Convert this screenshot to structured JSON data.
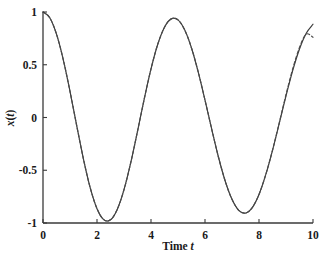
{
  "chart_data": {
    "type": "line",
    "title": "",
    "subtitle": "",
    "xlabel": "Time t",
    "xlabel_plain": "Time",
    "xlabel_italic": "t",
    "ylabel": "x(t)",
    "ylabel_italic_parts": [
      "x",
      "t"
    ],
    "xlim": [
      0,
      10
    ],
    "ylim": [
      -1,
      1
    ],
    "xticks": [
      0,
      2,
      4,
      6,
      8,
      10
    ],
    "xtick_labels": [
      "0",
      "2",
      "4",
      "6",
      "8",
      "10"
    ],
    "yticks": [
      -1,
      -0.5,
      0,
      0.5,
      1
    ],
    "ytick_labels": [
      "-1",
      "-0.5",
      "0",
      "0.5",
      "1"
    ],
    "grid": false,
    "legend": "none",
    "spines": [
      "left",
      "bottom"
    ],
    "series": [
      {
        "name": "exact",
        "style": "solid",
        "color": "#3a3a3a",
        "linewidth": 1.2,
        "formula": "cos(1.3225*t)",
        "amplitude": 1.0,
        "omega": 1.3225,
        "phase": 0,
        "x": [
          0,
          0.25,
          0.5,
          0.75,
          1,
          1.25,
          1.5,
          1.75,
          2,
          2.25,
          2.5,
          2.75,
          3,
          3.25,
          3.5,
          3.75,
          4,
          4.25,
          4.5,
          4.75,
          5,
          5.25,
          5.5,
          5.75,
          6,
          6.25,
          6.5,
          6.75,
          7,
          7.25,
          7.5,
          7.75,
          8,
          8.25,
          8.5,
          8.75,
          9,
          9.25,
          9.5,
          9.75,
          10
        ],
        "y": [
          1.0,
          0.946,
          0.79,
          0.549,
          0.248,
          -0.079,
          -0.396,
          -0.667,
          -0.864,
          -0.968,
          -0.97,
          -0.871,
          -0.684,
          -0.428,
          -0.131,
          0.176,
          0.46,
          0.694,
          0.856,
          0.935,
          0.925,
          0.829,
          0.659,
          0.43,
          0.165,
          -0.112,
          -0.377,
          -0.604,
          -0.776,
          -0.88,
          -0.906,
          -0.854,
          -0.729,
          -0.542,
          -0.311,
          -0.055,
          0.205,
          0.447,
          0.65,
          0.799,
          0.884
        ]
      },
      {
        "name": "approximation",
        "style": "dashed",
        "color": "#4a4a4a",
        "linewidth": 1.2,
        "formula": "cos(1.3225*t) with small growing phase drift",
        "amplitude": 1.0,
        "omega": 1.3225,
        "phase": 0,
        "x": [
          0,
          0.25,
          0.5,
          0.75,
          1,
          1.25,
          1.5,
          1.75,
          2,
          2.25,
          2.5,
          2.75,
          3,
          3.25,
          3.5,
          3.75,
          4,
          4.25,
          4.5,
          4.75,
          5,
          5.25,
          5.5,
          5.75,
          6,
          6.25,
          6.5,
          6.75,
          7,
          7.25,
          7.5,
          7.75,
          8,
          8.25,
          8.5,
          8.75,
          9,
          9.25,
          9.5,
          9.75,
          10
        ],
        "y": [
          1.0,
          0.946,
          0.79,
          0.549,
          0.248,
          -0.079,
          -0.396,
          -0.667,
          -0.864,
          -0.968,
          -0.97,
          -0.871,
          -0.684,
          -0.428,
          -0.131,
          0.176,
          0.46,
          0.694,
          0.856,
          0.935,
          0.925,
          0.829,
          0.659,
          0.43,
          0.165,
          -0.112,
          -0.377,
          -0.604,
          -0.776,
          -0.88,
          -0.906,
          -0.854,
          -0.729,
          -0.542,
          -0.311,
          -0.05,
          0.216,
          0.462,
          0.664,
          0.79,
          0.76
        ]
      }
    ],
    "extrema": {
      "maxima_t": [
        0,
        4.75,
        9.5
      ],
      "minima_t": [
        2.375,
        7.13
      ],
      "max_value": 1.0,
      "min_value": -1.0
    },
    "axis_color": "#3a3a3a",
    "background_color": "#ffffff"
  }
}
